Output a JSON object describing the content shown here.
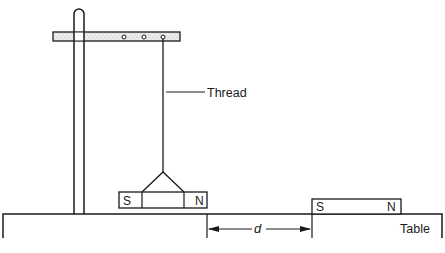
{
  "diagram": {
    "labels": {
      "thread": "Thread",
      "table": "Table",
      "distance": "d"
    },
    "hanging_magnet": {
      "left_pole": "S",
      "right_pole": "N"
    },
    "table_magnet": {
      "left_pole": "S",
      "right_pole": "N"
    },
    "stand": {
      "crossbar_holes": 3
    },
    "colors": {
      "ink": "#1a1a1a",
      "stipple": "#d8d8d8",
      "background": "#ffffff"
    }
  }
}
